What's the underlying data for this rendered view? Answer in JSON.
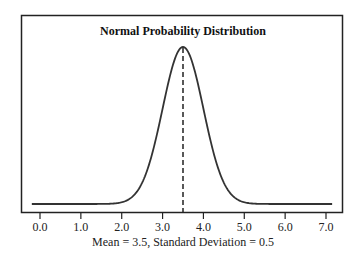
{
  "chart_data": {
    "type": "line",
    "title": "Normal Probability Distribution",
    "xlabel": "Mean = 3.5, Standard Deviation = 0.5",
    "ylabel": "",
    "distribution": "normal",
    "mean": 3.5,
    "std_dev": 0.5,
    "x_ticks": [
      0.0,
      1.0,
      2.0,
      3.0,
      4.0,
      5.0,
      6.0,
      7.0
    ],
    "x_tick_labels": [
      "0.0",
      "1.0",
      "2.0",
      "3.0",
      "4.0",
      "5.0",
      "6.0",
      "7.0"
    ],
    "xlim": [
      -0.2,
      7.15
    ],
    "y_ticks": [],
    "grid": false,
    "legend": null,
    "annotations": [
      {
        "type": "vertical-dashed-line",
        "x": 3.5,
        "label": "mean"
      }
    ],
    "series": [
      {
        "name": "Normal PDF",
        "x": [
          -0.2,
          1.0,
          1.5,
          2.0,
          2.5,
          3.0,
          3.25,
          3.5,
          3.75,
          4.0,
          4.5,
          5.0,
          5.5,
          6.0,
          7.15
        ],
        "values": [
          0.0,
          0.0,
          0.0,
          0.009,
          0.108,
          0.484,
          0.704,
          0.798,
          0.704,
          0.484,
          0.108,
          0.009,
          0.0,
          0.0,
          0.0
        ]
      }
    ],
    "colors": {
      "line": "#333333",
      "frame": "#222222",
      "background": "#ffffff"
    }
  }
}
